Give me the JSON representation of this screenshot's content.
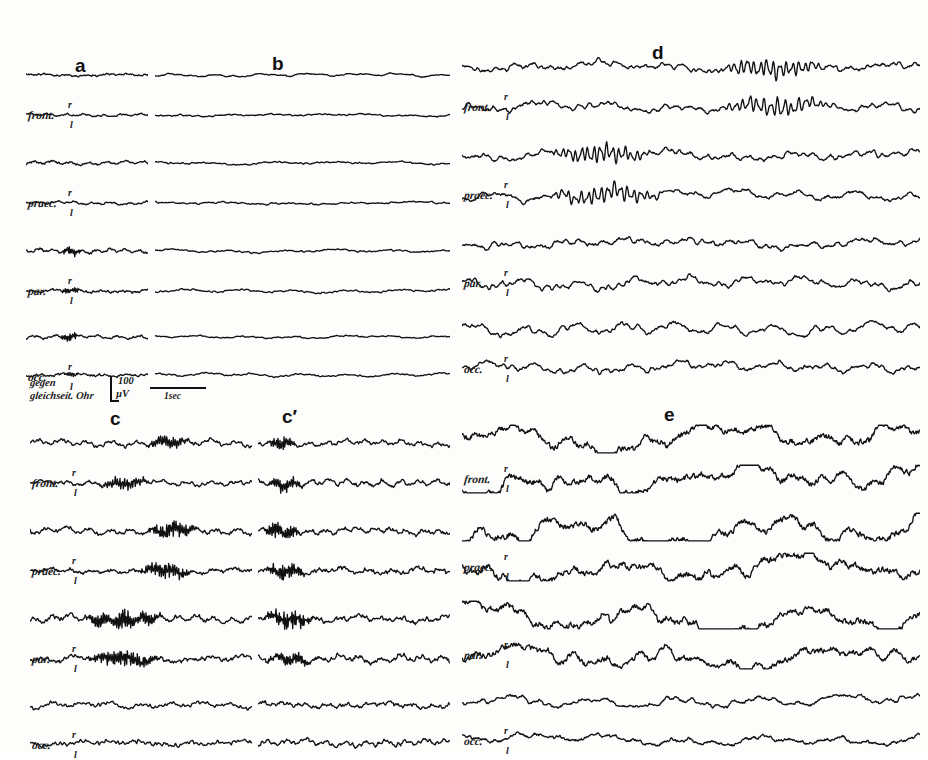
{
  "figure": {
    "kind": "eeg-recording-plate",
    "background_color": "#fdfdfc",
    "ink_color": "#111111",
    "width": 928,
    "height": 752
  },
  "panels": [
    {
      "id": "a",
      "letter": "a",
      "x": 75,
      "y": 56
    },
    {
      "id": "b",
      "letter": "b",
      "x": 272,
      "y": 54
    },
    {
      "id": "d",
      "letter": "d",
      "x": 652,
      "y": 43
    },
    {
      "id": "c",
      "letter": "c",
      "x": 110,
      "y": 409
    },
    {
      "id": "cp",
      "letter": "c′",
      "x": 282,
      "y": 407
    },
    {
      "id": "e",
      "letter": "e",
      "x": 664,
      "y": 405
    }
  ],
  "channels": [
    {
      "name": "front.",
      "right_mark": "r",
      "left_mark": "l"
    },
    {
      "name": "praec.",
      "right_mark": "r",
      "left_mark": "l"
    },
    {
      "name": "par.",
      "right_mark": "r",
      "left_mark": "l"
    },
    {
      "name": "occ.",
      "right_mark": "r",
      "left_mark": "l"
    }
  ],
  "calibration": {
    "reference_line1": "gegen",
    "reference_line2": "gleichseit. Ohr",
    "amplitude_value": "100",
    "amplitude_unit": "µV",
    "time_label": "1sec"
  },
  "chart_data": {
    "type": "line",
    "title": "",
    "xlabel": "",
    "ylabel": "",
    "grid": false,
    "legend": null,
    "calibration_amplitude_uV": 100,
    "calibration_time_sec": 1,
    "segments": [
      {
        "id": "a",
        "label": "a",
        "description": "low-voltage flat background, slight fast ripple",
        "amplitude_scale": 0.3,
        "frequency_scale": 1.0,
        "traces": [
          {
            "channel": "front.",
            "side": "r",
            "seed": 11,
            "amp": 0.26,
            "freq": 1.0,
            "burst": null
          },
          {
            "channel": "front.",
            "side": "l",
            "seed": 12,
            "amp": 0.24,
            "freq": 1.05,
            "burst": null
          },
          {
            "channel": "praec.",
            "side": "r",
            "seed": 13,
            "amp": 0.25,
            "freq": 1.0,
            "burst": null
          },
          {
            "channel": "praec.",
            "side": "l",
            "seed": 14,
            "amp": 0.27,
            "freq": 0.95,
            "burst": null
          },
          {
            "channel": "par.",
            "side": "r",
            "seed": 15,
            "amp": 0.3,
            "freq": 1.15,
            "burst": {
              "start": 0.28,
              "end": 0.46,
              "gain": 2.2,
              "fast": 3.3
            }
          },
          {
            "channel": "par.",
            "side": "l",
            "seed": 16,
            "amp": 0.27,
            "freq": 1.05,
            "burst": {
              "start": 0.28,
              "end": 0.45,
              "gain": 1.7,
              "fast": 3.0
            }
          },
          {
            "channel": "occ.",
            "side": "r",
            "seed": 17,
            "amp": 0.28,
            "freq": 1.1,
            "burst": {
              "start": 0.27,
              "end": 0.45,
              "gain": 2.4,
              "fast": 3.4
            }
          },
          {
            "channel": "occ.",
            "side": "l",
            "seed": 18,
            "amp": 0.26,
            "freq": 1.0,
            "burst": {
              "start": 0.3,
              "end": 0.44,
              "gain": 1.5,
              "fast": 2.8
            }
          }
        ]
      },
      {
        "id": "b",
        "label": "b",
        "description": "continued low-voltage desynchronised record",
        "amplitude_scale": 0.28,
        "frequency_scale": 1.0,
        "traces": [
          {
            "channel": "front.",
            "side": "r",
            "seed": 21,
            "amp": 0.24,
            "freq": 0.95,
            "burst": null
          },
          {
            "channel": "front.",
            "side": "l",
            "seed": 22,
            "amp": 0.26,
            "freq": 0.9,
            "burst": null
          },
          {
            "channel": "praec.",
            "side": "r",
            "seed": 23,
            "amp": 0.25,
            "freq": 1.0,
            "burst": null
          },
          {
            "channel": "praec.",
            "side": "l",
            "seed": 24,
            "amp": 0.27,
            "freq": 0.92,
            "burst": null
          },
          {
            "channel": "par.",
            "side": "r",
            "seed": 25,
            "amp": 0.26,
            "freq": 1.0,
            "burst": null
          },
          {
            "channel": "par.",
            "side": "l",
            "seed": 26,
            "amp": 0.25,
            "freq": 0.95,
            "burst": null
          },
          {
            "channel": "occ.",
            "side": "r",
            "seed": 27,
            "amp": 0.24,
            "freq": 0.98,
            "burst": null
          },
          {
            "channel": "occ.",
            "side": "l",
            "seed": 28,
            "amp": 0.26,
            "freq": 0.95,
            "burst": null
          }
        ]
      },
      {
        "id": "d",
        "label": "d",
        "description": "medium-voltage mixed theta/alpha with sharp transients",
        "amplitude_scale": 0.85,
        "frequency_scale": 1.25,
        "traces": [
          {
            "channel": "front.",
            "side": "r",
            "seed": 31,
            "amp": 0.82,
            "freq": 1.3,
            "burst": {
              "start": 0.55,
              "end": 0.8,
              "gain": 1.7,
              "fast": 2.6
            }
          },
          {
            "channel": "front.",
            "side": "l",
            "seed": 32,
            "amp": 0.8,
            "freq": 1.25,
            "burst": {
              "start": 0.55,
              "end": 0.82,
              "gain": 1.7,
              "fast": 2.5
            }
          },
          {
            "channel": "praec.",
            "side": "r",
            "seed": 33,
            "amp": 0.86,
            "freq": 1.3,
            "burst": {
              "start": 0.18,
              "end": 0.42,
              "gain": 1.6,
              "fast": 2.7
            }
          },
          {
            "channel": "praec.",
            "side": "l",
            "seed": 34,
            "amp": 0.84,
            "freq": 1.28,
            "burst": {
              "start": 0.18,
              "end": 0.45,
              "gain": 1.6,
              "fast": 2.6
            }
          },
          {
            "channel": "par.",
            "side": "r",
            "seed": 35,
            "amp": 0.9,
            "freq": 1.22,
            "burst": null
          },
          {
            "channel": "par.",
            "side": "l",
            "seed": 36,
            "amp": 0.92,
            "freq": 1.2,
            "burst": null
          },
          {
            "channel": "occ.",
            "side": "r",
            "seed": 37,
            "amp": 0.88,
            "freq": 1.3,
            "burst": null
          },
          {
            "channel": "occ.",
            "side": "l",
            "seed": 38,
            "amp": 0.86,
            "freq": 1.28,
            "burst": null
          }
        ]
      },
      {
        "id": "c",
        "label": "c",
        "description": "low-voltage background interrupted by runs of high-frequency spindle-like activity",
        "amplitude_scale": 0.55,
        "frequency_scale": 1.6,
        "traces": [
          {
            "channel": "front.",
            "side": "r",
            "seed": 41,
            "amp": 0.5,
            "freq": 1.55,
            "burst": {
              "start": 0.52,
              "end": 0.72,
              "gain": 2.1,
              "fast": 3.2
            }
          },
          {
            "channel": "front.",
            "side": "l",
            "seed": 42,
            "amp": 0.48,
            "freq": 1.5,
            "burst": {
              "start": 0.3,
              "end": 0.55,
              "gain": 1.9,
              "fast": 3.0
            }
          },
          {
            "channel": "praec.",
            "side": "r",
            "seed": 43,
            "amp": 0.55,
            "freq": 1.6,
            "burst": {
              "start": 0.52,
              "end": 0.76,
              "gain": 2.4,
              "fast": 3.4
            }
          },
          {
            "channel": "praec.",
            "side": "l",
            "seed": 44,
            "amp": 0.54,
            "freq": 1.58,
            "burst": {
              "start": 0.48,
              "end": 0.74,
              "gain": 2.3,
              "fast": 3.3
            }
          },
          {
            "channel": "par.",
            "side": "r",
            "seed": 45,
            "amp": 0.62,
            "freq": 1.7,
            "burst": {
              "start": 0.22,
              "end": 0.62,
              "gain": 2.2,
              "fast": 3.5
            }
          },
          {
            "channel": "par.",
            "side": "l",
            "seed": 46,
            "amp": 0.6,
            "freq": 1.65,
            "burst": {
              "start": 0.25,
              "end": 0.6,
              "gain": 2.0,
              "fast": 3.3
            }
          },
          {
            "channel": "occ.",
            "side": "r",
            "seed": 47,
            "amp": 0.5,
            "freq": 1.45,
            "burst": null
          },
          {
            "channel": "occ.",
            "side": "l",
            "seed": 48,
            "amp": 0.52,
            "freq": 1.5,
            "burst": null
          }
        ]
      },
      {
        "id": "c'",
        "label": "c′",
        "description": "continuation of c, further bursts of fast activity",
        "amplitude_scale": 0.58,
        "frequency_scale": 1.6,
        "traces": [
          {
            "channel": "front.",
            "side": "r",
            "seed": 51,
            "amp": 0.52,
            "freq": 1.55,
            "burst": {
              "start": 0.04,
              "end": 0.2,
              "gain": 2.0,
              "fast": 3.0
            }
          },
          {
            "channel": "front.",
            "side": "l",
            "seed": 52,
            "amp": 0.52,
            "freq": 1.52,
            "burst": {
              "start": 0.05,
              "end": 0.24,
              "gain": 2.1,
              "fast": 3.1
            }
          },
          {
            "channel": "praec.",
            "side": "r",
            "seed": 53,
            "amp": 0.58,
            "freq": 1.6,
            "burst": {
              "start": 0.02,
              "end": 0.22,
              "gain": 2.3,
              "fast": 3.2
            }
          },
          {
            "channel": "praec.",
            "side": "l",
            "seed": 54,
            "amp": 0.56,
            "freq": 1.58,
            "burst": {
              "start": 0.03,
              "end": 0.26,
              "gain": 2.2,
              "fast": 3.1
            }
          },
          {
            "channel": "par.",
            "side": "r",
            "seed": 55,
            "amp": 0.62,
            "freq": 1.68,
            "burst": {
              "start": 0.02,
              "end": 0.3,
              "gain": 2.3,
              "fast": 3.4
            }
          },
          {
            "channel": "par.",
            "side": "l",
            "seed": 56,
            "amp": 0.6,
            "freq": 1.64,
            "burst": {
              "start": 0.02,
              "end": 0.28,
              "gain": 2.1,
              "fast": 3.2
            }
          },
          {
            "channel": "occ.",
            "side": "r",
            "seed": 57,
            "amp": 0.55,
            "freq": 1.48,
            "burst": null
          },
          {
            "channel": "occ.",
            "side": "l",
            "seed": 58,
            "amp": 0.56,
            "freq": 1.5,
            "burst": null
          }
        ]
      },
      {
        "id": "e",
        "label": "e",
        "description": "high-voltage slow delta waves, maximal frontally and parietally",
        "amplitude_scale": 2.3,
        "frequency_scale": 0.45,
        "traces": [
          {
            "channel": "front.",
            "side": "r",
            "seed": 61,
            "amp": 2.3,
            "freq": 0.45,
            "burst": null
          },
          {
            "channel": "front.",
            "side": "l",
            "seed": 62,
            "amp": 2.4,
            "freq": 0.45,
            "burst": null
          },
          {
            "channel": "praec.",
            "side": "r",
            "seed": 63,
            "amp": 2.5,
            "freq": 0.44,
            "burst": null
          },
          {
            "channel": "praec.",
            "side": "l",
            "seed": 64,
            "amp": 2.45,
            "freq": 0.44,
            "burst": null
          },
          {
            "channel": "par.",
            "side": "r",
            "seed": 65,
            "amp": 2.35,
            "freq": 0.46,
            "burst": null
          },
          {
            "channel": "par.",
            "side": "l",
            "seed": 66,
            "amp": 2.2,
            "freq": 0.46,
            "burst": null
          },
          {
            "channel": "occ.",
            "side": "r",
            "seed": 67,
            "amp": 0.95,
            "freq": 0.8,
            "burst": null
          },
          {
            "channel": "occ.",
            "side": "l",
            "seed": 68,
            "amp": 1.0,
            "freq": 0.8,
            "burst": null
          }
        ]
      }
    ]
  },
  "layout": {
    "blocks": [
      {
        "id": "a",
        "x": 26,
        "y": 60,
        "w": 122,
        "h": 308,
        "labels": true,
        "calib": true
      },
      {
        "id": "b",
        "x": 155,
        "y": 60,
        "w": 295,
        "h": 308,
        "labels": false,
        "calib": false
      },
      {
        "id": "d",
        "x": 462,
        "y": 52,
        "w": 458,
        "h": 320,
        "labels": true,
        "calib": false
      },
      {
        "id": "c",
        "x": 30,
        "y": 428,
        "w": 222,
        "h": 300,
        "labels": true,
        "calib": false
      },
      {
        "id": "c'",
        "x": 258,
        "y": 428,
        "w": 192,
        "h": 300,
        "labels": false,
        "calib": false
      },
      {
        "id": "e",
        "x": 462,
        "y": 424,
        "w": 458,
        "h": 304,
        "labels": true,
        "calib": false
      }
    ],
    "row_offsets": [
      0,
      40,
      88,
      128,
      176,
      216,
      262,
      300
    ],
    "pair_label_offsets": [
      56,
      144,
      232,
      318
    ]
  }
}
